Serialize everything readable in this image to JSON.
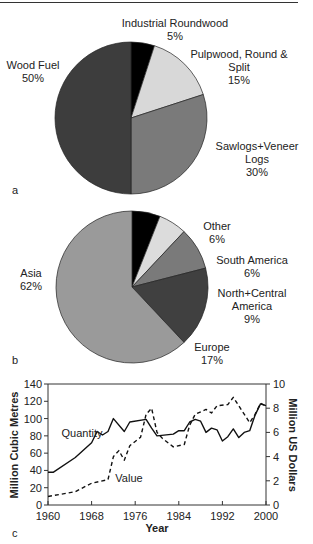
{
  "chart_data": [
    {
      "type": "pie",
      "panel": "a",
      "title": "",
      "slices": [
        {
          "label": "Industrial Roundwood",
          "value": 5,
          "color": "#000000"
        },
        {
          "label": "Pulpwood, Round & Split",
          "value": 15,
          "color": "#d8d8d8"
        },
        {
          "label": "Sawlogs+Veneer Logs",
          "value": 30,
          "color": "#7a7a7a"
        },
        {
          "label": "Wood Fuel",
          "value": 50,
          "color": "#3d3d3d"
        }
      ]
    },
    {
      "type": "pie",
      "panel": "b",
      "title": "",
      "slices": [
        {
          "label": "Other",
          "value": 6,
          "color": "#000000"
        },
        {
          "label": "South America",
          "value": 6,
          "color": "#dcdcdc"
        },
        {
          "label": "North+Central America",
          "value": 9,
          "color": "#7a7a7a"
        },
        {
          "label": "Europe",
          "value": 17,
          "color": "#404040"
        },
        {
          "label": "Asia",
          "value": 62,
          "color": "#9a9a9a"
        }
      ]
    },
    {
      "type": "line",
      "panel": "c",
      "title": "",
      "xlabel": "Year",
      "ylabel": "Million Cubic Metres",
      "y2label": "Million US Dollars",
      "xlim": [
        1960,
        2000
      ],
      "ylim": [
        0,
        140
      ],
      "y2lim": [
        0,
        10
      ],
      "xticks": [
        1960,
        1968,
        1976,
        1984,
        1992,
        2000
      ],
      "yticks": [
        0,
        20,
        40,
        60,
        80,
        100,
        120,
        140
      ],
      "y2ticks": [
        0,
        2,
        4,
        6,
        8,
        10
      ],
      "grid": false,
      "series": [
        {
          "name": "Quantity",
          "axis": "left",
          "style": "solid",
          "x": [
            1960,
            1961,
            1965,
            1968,
            1969,
            1970,
            1971,
            1972,
            1974,
            1975,
            1978,
            1979,
            1980,
            1983,
            1984,
            1985,
            1986,
            1987,
            1988,
            1989,
            1990,
            1991,
            1992,
            1993,
            1994,
            1995,
            1996,
            1997,
            1998,
            1999,
            2000
          ],
          "values": [
            38,
            38,
            55,
            72,
            85,
            81,
            85,
            100,
            85,
            96,
            99,
            89,
            80,
            82,
            86,
            86,
            96,
            99,
            97,
            84,
            89,
            87,
            74,
            79,
            88,
            78,
            84,
            86,
            104,
            117,
            115
          ]
        },
        {
          "name": "Value",
          "axis": "right",
          "style": "dashed",
          "x": [
            1960,
            1965,
            1968,
            1971,
            1972,
            1973,
            1974,
            1975,
            1977,
            1978,
            1979,
            1980,
            1981,
            1983,
            1985,
            1986,
            1987,
            1989,
            1990,
            1991,
            1993,
            1994,
            1997,
            1998,
            1999,
            2000
          ],
          "values": [
            0.7,
            1.1,
            1.8,
            2.1,
            4.0,
            4.5,
            3.7,
            4.9,
            5.6,
            7.5,
            8.0,
            6.0,
            5.5,
            4.8,
            5.0,
            6.6,
            7.5,
            7.9,
            7.6,
            8.2,
            8.3,
            8.9,
            6.8,
            7.5,
            8.4,
            8.2
          ]
        }
      ],
      "annotations": [
        {
          "text": "Quantity",
          "near": "solid line ~1966"
        },
        {
          "text": "Value",
          "near": "dashed line ~1974"
        }
      ]
    }
  ],
  "labels": {
    "pie_a": {
      "industrial_name": "Industrial Roundwood",
      "industrial_pct": "5%",
      "pulp_name1": "Pulpwood, Round &",
      "pulp_name2": "Split",
      "pulp_pct": "15%",
      "saw_name1": "Sawlogs+Veneer",
      "saw_name2": "Logs",
      "saw_pct": "30%",
      "fuel_name": "Wood Fuel",
      "fuel_pct": "50%",
      "panel": "a"
    },
    "pie_b": {
      "other_name": "Other",
      "other_pct": "6%",
      "sa_name": "South America",
      "sa_pct": "6%",
      "nca_name1": "North+Central",
      "nca_name2": "America",
      "nca_pct": "9%",
      "europe_name": "Europe",
      "europe_pct": "17%",
      "asia_name": "Asia",
      "asia_pct": "62%",
      "panel": "b"
    },
    "line": {
      "panel": "c",
      "xlabel": "Year",
      "ylabel": "Million Cubic Metres",
      "y2label": "Million US Dollars",
      "quantity_label": "Quantity",
      "value_label": "Value"
    }
  }
}
